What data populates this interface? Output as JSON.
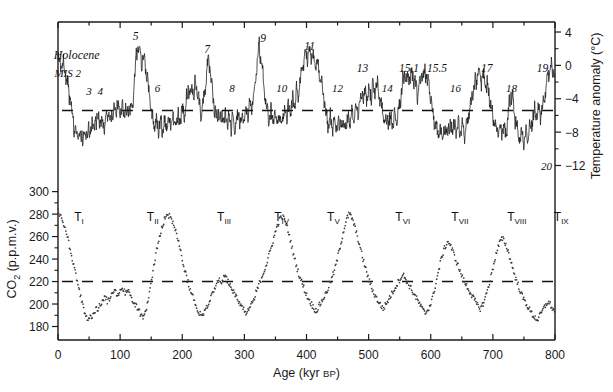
{
  "figure": {
    "background": "#ffffff",
    "line_color": "#1a1a1a",
    "dot_color": "#3a3a3a"
  },
  "chart_data": {
    "type": "line",
    "title": "",
    "xlabel": "Age (kyr BP)",
    "xlim": [
      0,
      800
    ],
    "xticks": [
      0,
      100,
      200,
      300,
      400,
      500,
      600,
      700,
      800
    ],
    "xticklabels": [
      "0",
      "100",
      "200",
      "300",
      "400",
      "500",
      "600",
      "700",
      "800"
    ],
    "xminor_step": 50,
    "grid": false,
    "legend": "none",
    "panels": [
      {
        "id": "temperature",
        "ylabel": "Temperature anomaly (°C)",
        "ylabel_side": "right",
        "ylim": [
          -13.5,
          5.2
        ],
        "yticks": [
          4,
          0,
          -4,
          -8,
          -12
        ],
        "yticklabels": [
          "4",
          "0",
          "−4",
          "−8",
          "−12"
        ],
        "yminor": [
          2,
          -2,
          -6,
          -10
        ],
        "reference_line": -5.4,
        "reference_line_style": "dashed",
        "series_name": "Antarctic temperature anomaly (deuterium-derived)",
        "series_style": "solid-line",
        "units": "°C"
      },
      {
        "id": "co2",
        "ylabel": "CO2 (p.p.m.v.)",
        "ylabel_side": "left",
        "ylim": [
          168,
          305
        ],
        "yticks": [
          300,
          280,
          260,
          240,
          220,
          200,
          180
        ],
        "yticklabels": [
          "300",
          "280",
          "260",
          "240",
          "220",
          "200",
          "180"
        ],
        "reference_line": 220,
        "reference_line_style": "dashed",
        "series_name": "Atmospheric CO2 concentration",
        "series_style": "scatter-dots",
        "units": "p.p.m.v."
      }
    ],
    "temperature_peaks_labels": [
      {
        "label": "5",
        "age": 125,
        "kind": "interglacial"
      },
      {
        "label": "7",
        "age": 240,
        "kind": "interglacial"
      },
      {
        "label": "9",
        "age": 330,
        "kind": "interglacial"
      },
      {
        "label": "11",
        "age": 405,
        "kind": "interglacial"
      },
      {
        "label": "13",
        "age": 490,
        "kind": "interglacial"
      },
      {
        "label": "15.1",
        "age": 565,
        "kind": "interglacial"
      },
      {
        "label": "15.5",
        "age": 610,
        "kind": "interglacial"
      },
      {
        "label": "17",
        "age": 690,
        "kind": "interglacial"
      },
      {
        "label": "19",
        "age": 780,
        "kind": "interglacial"
      }
    ],
    "temperature_trough_labels": [
      {
        "label": "MIS 2",
        "age": 22,
        "kind": "glacial"
      },
      {
        "label": "3",
        "age": 50,
        "kind": "glacial"
      },
      {
        "label": "4",
        "age": 68,
        "kind": "glacial"
      },
      {
        "label": "6",
        "age": 160,
        "kind": "glacial"
      },
      {
        "label": "8",
        "age": 280,
        "kind": "glacial"
      },
      {
        "label": "10",
        "age": 360,
        "kind": "glacial"
      },
      {
        "label": "12",
        "age": 450,
        "kind": "glacial"
      },
      {
        "label": "14",
        "age": 530,
        "kind": "glacial"
      },
      {
        "label": "16",
        "age": 640,
        "kind": "glacial"
      },
      {
        "label": "18",
        "age": 730,
        "kind": "glacial"
      },
      {
        "label": "20",
        "age": 800,
        "kind": "glacial"
      }
    ],
    "holocene_label": "Holocene",
    "terminations": [
      {
        "label": "T",
        "numeral": "I",
        "age": 18
      },
      {
        "label": "T",
        "numeral": "II",
        "age": 135
      },
      {
        "label": "T",
        "numeral": "III",
        "age": 248
      },
      {
        "label": "T",
        "numeral": "IV",
        "age": 340
      },
      {
        "label": "T",
        "numeral": "V",
        "age": 425
      },
      {
        "label": "T",
        "numeral": "VI",
        "age": 535
      },
      {
        "label": "T",
        "numeral": "VII",
        "age": 625
      },
      {
        "label": "T",
        "numeral": "VIII",
        "age": 715
      },
      {
        "label": "T",
        "numeral": "IX",
        "age": 790
      }
    ],
    "temperature_series": {
      "name": "Temperature anomaly",
      "x": [
        0,
        3,
        6,
        9,
        12,
        15,
        18,
        21,
        24,
        27,
        30,
        33,
        36,
        39,
        42,
        45,
        48,
        51,
        54,
        57,
        60,
        63,
        66,
        69,
        72,
        75,
        78,
        81,
        84,
        87,
        90,
        93,
        96,
        99,
        102,
        105,
        108,
        111,
        114,
        117,
        120,
        123,
        126,
        129,
        132,
        135,
        138,
        141,
        144,
        147,
        150,
        153,
        156,
        159,
        162,
        165,
        168,
        171,
        174,
        177,
        180,
        183,
        186,
        189,
        192,
        195,
        198,
        201,
        204,
        207,
        210,
        213,
        216,
        219,
        222,
        225,
        228,
        231,
        234,
        237,
        240,
        243,
        246,
        249,
        252,
        255,
        258,
        261,
        264,
        267,
        270,
        273,
        276,
        279,
        282,
        285,
        288,
        291,
        294,
        297,
        300,
        303,
        306,
        309,
        312,
        315,
        318,
        321,
        324,
        327,
        330,
        333,
        336,
        339,
        342,
        345,
        348,
        351,
        354,
        357,
        360,
        363,
        366,
        369,
        372,
        375,
        378,
        381,
        384,
        387,
        390,
        393,
        396,
        399,
        402,
        405,
        408,
        411,
        414,
        417,
        420,
        423,
        426,
        429,
        432,
        435,
        438,
        441,
        444,
        447,
        450,
        453,
        456,
        459,
        462,
        465,
        468,
        471,
        474,
        477,
        480,
        483,
        486,
        489,
        492,
        495,
        498,
        501,
        504,
        507,
        510,
        513,
        516,
        519,
        522,
        525,
        528,
        531,
        534,
        537,
        540,
        543,
        546,
        549,
        552,
        555,
        558,
        561,
        564,
        567,
        570,
        573,
        576,
        579,
        582,
        585,
        588,
        591,
        594,
        597,
        600,
        603,
        606,
        609,
        612,
        615,
        618,
        621,
        624,
        627,
        630,
        633,
        636,
        639,
        642,
        645,
        648,
        651,
        654,
        657,
        660,
        663,
        666,
        669,
        672,
        675,
        678,
        681,
        684,
        687,
        690,
        693,
        696,
        699,
        702,
        705,
        708,
        711,
        714,
        717,
        720,
        723,
        726,
        729,
        732,
        735,
        738,
        741,
        744,
        747,
        750,
        753,
        756,
        759,
        762,
        765,
        768,
        771,
        774,
        777,
        780,
        783,
        786,
        789,
        792,
        795,
        798,
        800
      ],
      "y": [
        0.4,
        0.2,
        -0.4,
        0.3,
        -1.0,
        -2.2,
        -3.4,
        -5.0,
        -6.3,
        -7.8,
        -8.4,
        -8.0,
        -8.8,
        -8.3,
        -8.9,
        -8.2,
        -7.5,
        -8.0,
        -6.8,
        -7.6,
        -6.4,
        -7.2,
        -6.0,
        -7.0,
        -6.6,
        -7.4,
        -6.2,
        -5.5,
        -6.4,
        -5.2,
        -6.0,
        -5.4,
        -4.8,
        -5.6,
        -5.0,
        -5.8,
        -5.1,
        -5.9,
        -5.0,
        -5.7,
        -4.4,
        -2.0,
        1.2,
        2.6,
        1.5,
        0.6,
        1.1,
        -0.2,
        -1.6,
        -3.4,
        -5.2,
        -6.6,
        -7.4,
        -6.9,
        -7.8,
        -7.0,
        -7.6,
        -6.8,
        -7.4,
        -6.6,
        -7.2,
        -6.4,
        -7.0,
        -6.2,
        -6.8,
        -6.0,
        -6.6,
        -5.4,
        -6.2,
        -4.2,
        -2.6,
        -4.0,
        -2.2,
        -3.6,
        -1.8,
        -3.4,
        -4.8,
        -5.8,
        -4.6,
        -2.8,
        -0.4,
        0.8,
        -1.2,
        -3.2,
        -5.0,
        -6.2,
        -5.4,
        -6.6,
        -5.8,
        -6.8,
        -6.0,
        -7.0,
        -6.2,
        -7.2,
        -6.4,
        -7.4,
        -6.6,
        -6.0,
        -6.8,
        -5.6,
        -6.4,
        -5.0,
        -5.8,
        -4.6,
        -5.4,
        -3.8,
        -1.6,
        1.0,
        2.2,
        0.4,
        -1.4,
        -3.2,
        -5.0,
        -6.4,
        -5.6,
        -6.6,
        -5.8,
        -6.8,
        -6.0,
        -6.9,
        -6.1,
        -6.6,
        -5.4,
        -6.0,
        -4.8,
        -5.4,
        -4.0,
        -4.6,
        -3.2,
        -3.8,
        -2.0,
        -0.6,
        0.6,
        1.4,
        1.0,
        1.6,
        1.2,
        0.4,
        -0.2,
        0.3,
        -0.6,
        -1.4,
        -2.6,
        -4.4,
        -6.0,
        -7.2,
        -6.4,
        -7.4,
        -6.6,
        -7.6,
        -6.8,
        -7.8,
        -7.0,
        -7.6,
        -6.8,
        -7.2,
        -6.2,
        -6.8,
        -5.6,
        -6.2,
        -4.8,
        -5.4,
        -4.2,
        -3.2,
        -4.0,
        -3.0,
        -3.8,
        -2.8,
        -3.6,
        -2.6,
        -3.4,
        -2.4,
        -3.2,
        -4.2,
        -5.4,
        -6.4,
        -7.0,
        -6.4,
        -7.0,
        -6.2,
        -6.8,
        -6.0,
        -6.6,
        -5.2,
        -3.6,
        -2.2,
        -1.2,
        -2.0,
        -1.0,
        -1.8,
        -0.8,
        -1.6,
        -2.4,
        -3.4,
        -2.0,
        -0.8,
        -1.6,
        -0.6,
        -1.4,
        -2.2,
        -3.6,
        -5.4,
        -6.8,
        -7.8,
        -8.4,
        -7.8,
        -8.6,
        -7.6,
        -8.2,
        -7.2,
        -8.0,
        -7.0,
        -7.8,
        -6.8,
        -7.6,
        -7.0,
        -7.8,
        -7.2,
        -8.0,
        -7.4,
        -6.2,
        -5.0,
        -3.8,
        -2.8,
        -2.0,
        -1.4,
        -1.0,
        -1.6,
        -1.2,
        -1.8,
        -2.4,
        -3.2,
        -4.2,
        -5.4,
        -6.6,
        -7.6,
        -8.2,
        -7.6,
        -8.2,
        -7.4,
        -8.0,
        -7.2,
        -4.8,
        -3.4,
        -4.2,
        -5.6,
        -7.2,
        -8.2,
        -8.8,
        -8.2,
        -8.8,
        -8.0,
        -8.6,
        -7.8,
        -7.0,
        -6.2,
        -5.4,
        -6.0,
        -5.2,
        -5.8,
        -5.0,
        -4.0,
        -2.6,
        -1.2,
        -0.2,
        -0.6,
        -1.2,
        -2.0,
        -1.4,
        -2.2,
        -3.0,
        -4.2,
        -5.8,
        -7.2,
        -8.4,
        -9.2,
        -9.8,
        -10.2
      ]
    },
    "co2_series": {
      "name": "CO2 concentration",
      "x": [
        0,
        4,
        8,
        12,
        16,
        20,
        24,
        28,
        32,
        36,
        40,
        44,
        48,
        52,
        56,
        60,
        64,
        68,
        72,
        76,
        80,
        84,
        88,
        92,
        96,
        100,
        104,
        108,
        112,
        116,
        120,
        124,
        128,
        132,
        136,
        140,
        144,
        148,
        152,
        156,
        160,
        164,
        168,
        172,
        176,
        180,
        184,
        188,
        192,
        196,
        200,
        204,
        208,
        212,
        216,
        220,
        224,
        228,
        232,
        236,
        240,
        244,
        248,
        252,
        256,
        260,
        264,
        268,
        272,
        276,
        280,
        284,
        288,
        292,
        296,
        300,
        304,
        308,
        312,
        316,
        320,
        324,
        328,
        332,
        336,
        340,
        344,
        348,
        352,
        356,
        360,
        364,
        368,
        372,
        376,
        380,
        384,
        388,
        392,
        396,
        400,
        404,
        408,
        412,
        416,
        420,
        424,
        428,
        432,
        436,
        440,
        444,
        448,
        452,
        456,
        460,
        464,
        468,
        472,
        476,
        480,
        484,
        488,
        492,
        496,
        500,
        504,
        508,
        512,
        516,
        520,
        524,
        528,
        532,
        536,
        540,
        544,
        548,
        552,
        556,
        560,
        564,
        568,
        572,
        576,
        580,
        584,
        588,
        592,
        596,
        600,
        604,
        608,
        612,
        616,
        620,
        624,
        628,
        632,
        636,
        640,
        644,
        648,
        652,
        656,
        660,
        664,
        668,
        672,
        676,
        680,
        684,
        688,
        692,
        696,
        700,
        704,
        708,
        712,
        716,
        720,
        724,
        728,
        732,
        736,
        740,
        744,
        748,
        752,
        756,
        760,
        764,
        768,
        772,
        776,
        780,
        784,
        788,
        792,
        796,
        800
      ],
      "y": [
        282,
        278,
        272,
        266,
        258,
        248,
        238,
        228,
        218,
        208,
        198,
        190,
        186,
        188,
        190,
        194,
        196,
        200,
        204,
        206,
        202,
        206,
        210,
        212,
        208,
        212,
        214,
        210,
        214,
        208,
        204,
        200,
        196,
        192,
        188,
        192,
        200,
        212,
        226,
        240,
        252,
        262,
        270,
        276,
        280,
        278,
        274,
        268,
        260,
        250,
        240,
        230,
        222,
        214,
        208,
        202,
        196,
        192,
        190,
        194,
        198,
        204,
        210,
        214,
        218,
        222,
        220,
        224,
        222,
        218,
        214,
        210,
        206,
        202,
        198,
        194,
        192,
        196,
        200,
        206,
        212,
        218,
        224,
        230,
        236,
        244,
        252,
        260,
        268,
        274,
        278,
        276,
        270,
        262,
        252,
        242,
        234,
        226,
        220,
        214,
        208,
        204,
        200,
        196,
        194,
        198,
        202,
        206,
        210,
        216,
        222,
        228,
        236,
        246,
        256,
        266,
        274,
        280,
        278,
        272,
        264,
        256,
        246,
        238,
        230,
        222,
        216,
        210,
        206,
        202,
        198,
        196,
        200,
        204,
        208,
        212,
        216,
        220,
        224,
        226,
        222,
        218,
        214,
        210,
        206,
        202,
        198,
        194,
        192,
        196,
        200,
        208,
        218,
        228,
        238,
        246,
        252,
        256,
        252,
        246,
        240,
        234,
        228,
        222,
        218,
        214,
        210,
        206,
        202,
        198,
        196,
        200,
        206,
        214,
        222,
        232,
        242,
        250,
        256,
        258,
        254,
        248,
        240,
        232,
        224,
        218,
        212,
        206,
        202,
        198,
        194,
        190,
        188,
        186,
        190,
        194,
        198,
        202,
        200,
        196,
        192,
        190,
        194,
        200,
        210,
        222,
        234,
        246,
        256,
        264,
        270,
        274,
        272,
        266,
        258
      ]
    }
  },
  "axes": {
    "x_axis_label": "Age (kyr BP)",
    "x_axis_label_main": "Age (kyr",
    "x_axis_label_sub": "BP",
    "x_axis_label_end": ")",
    "left_axis_label_co2": "CO",
    "left_axis_label_co2_sub": "2",
    "left_axis_label_co2_unit": " (p.p.m.v.)",
    "right_axis_label_temp": "Temperature anomaly (°C)"
  }
}
